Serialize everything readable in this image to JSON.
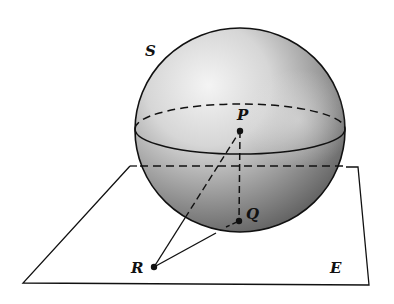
{
  "figure": {
    "type": "geometry-diagram",
    "labels": {
      "sphere": "S",
      "plane": "E",
      "point_p": "P",
      "point_q": "Q",
      "point_r": "R"
    },
    "colors": {
      "stroke": "#111111",
      "sphere_light": "#f2f2f2",
      "sphere_dark": "#5a5a5a",
      "background": "#ffffff"
    }
  }
}
